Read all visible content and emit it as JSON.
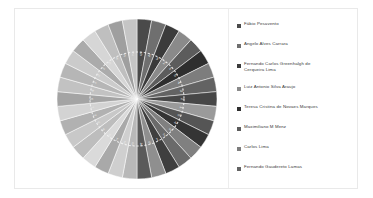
{
  "chart_data": {
    "type": "pie",
    "title": "",
    "subtitle": "",
    "xlabel": "",
    "ylabel": "",
    "legend_position": "right",
    "grid": false,
    "inner_ring_labels": [
      "5",
      "4",
      "3",
      "2",
      "1"
    ],
    "categories": [
      "Fábio Pesavento",
      "Angelo Alves Carrara",
      "Fernando Carlos Greenhalgh de Cerqueira Lima",
      "Luiz Antonio Silva Araujo",
      "Teresa Cristina de Novaes Marques",
      "Maximiliano M Menz",
      "Carlos Lima",
      "Fernando Gaudereto Lamas"
    ],
    "values": [
      1,
      1,
      1,
      1,
      1,
      1,
      1,
      1
    ],
    "slice_count": 34,
    "slice_values": [
      1,
      1,
      1,
      1,
      1,
      1,
      1,
      1,
      1,
      1,
      1,
      1,
      1,
      1,
      1,
      1,
      1,
      1,
      1,
      1,
      1,
      1,
      1,
      1,
      1,
      1,
      1,
      1,
      1,
      1,
      1,
      1,
      1,
      1
    ],
    "slice_colors": [
      "#4a4a4a",
      "#6f6f6f",
      "#3b3b3b",
      "#8a8a8a",
      "#5c5c5c",
      "#2e2e2e",
      "#7d7d7d",
      "#636363",
      "#474747",
      "#9a9a9a",
      "#555555",
      "#343434",
      "#808080",
      "#6a6a6a",
      "#3f3f3f",
      "#8f8f8f",
      "#5a5a5a",
      "#b8b8b8",
      "#cfcfcf",
      "#a9a9a9",
      "#dadada",
      "#bdbdbd",
      "#c8c8c8",
      "#b1b1b1",
      "#d3d3d3",
      "#a4a4a4",
      "#c2c2c2",
      "#b6b6b6",
      "#cbcbcb",
      "#ababab",
      "#d6d6d6",
      "#bfbfbf",
      "#9f9f9f",
      "#c5c5c5"
    ]
  },
  "legend": {
    "items": [
      {
        "label": "Fábio Pesavento",
        "color": "#4a4a4a"
      },
      {
        "label": "Angelo Alves Carrara",
        "color": "#6f6f6f"
      },
      {
        "label": "Fernando Carlos Greenhalgh de\nCerqueira Lima",
        "color": "#3b3b3b"
      },
      {
        "label": "Luiz Antonio Silva Araujo",
        "color": "#8a8a8a"
      },
      {
        "label": "Teresa Cristina de Novaes Marques",
        "color": "#2e2e2e"
      },
      {
        "label": "Maximiliano M Menz",
        "color": "#5c5c5c"
      },
      {
        "label": "Carlos Lima",
        "color": "#7d7d7d"
      },
      {
        "label": "Fernando Gaudereto Lamas",
        "color": "#636363"
      }
    ]
  },
  "colors": {
    "card_background": "#ffffff",
    "card_border": "#e9e9e9",
    "divider": "#ededed",
    "ring_stroke": "#f2f2f2",
    "label_text": "#3a3a3a",
    "inner_label_text": "#e8e8e8"
  }
}
